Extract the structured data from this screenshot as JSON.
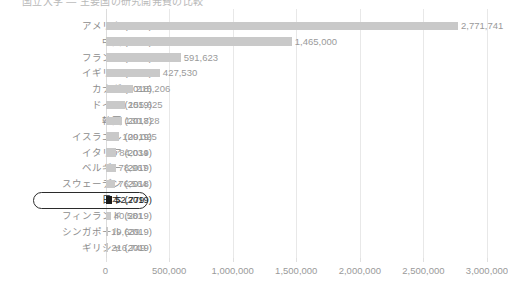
{
  "title": {
    "text": "国立大学 ― 主要国の研究開発費の比較",
    "visible_cropped": true
  },
  "chart_data": {
    "type": "bar",
    "orientation": "horizontal",
    "title": "",
    "xlabel": "",
    "ylabel": "",
    "xlim": [
      0,
      3000000
    ],
    "xticks": [
      0,
      500000,
      1000000,
      1500000,
      2000000,
      2500000,
      3000000
    ],
    "xtick_labels": [
      "0",
      "500,000",
      "1,000,000",
      "1,500,000",
      "2,000,000",
      "2,500,000",
      "3,000,000"
    ],
    "grid": true,
    "legend": "none",
    "highlight_category": "日本 (2019)",
    "categories": [
      "アメリカ (2018)",
      "中国 (2019)",
      "フランス (2018)",
      "イギリス (2019)",
      "カナダ (2018)",
      "ドイツ (2019)",
      "韓国 (2018)",
      "イスラエル (2019)",
      "イタリア (2019)",
      "ベルギー (2019)",
      "スウェーデン (2018)",
      "日本 (2019)",
      "フィンランド (2019)",
      "シンガポール (2019)",
      "ギリシャ (2019)"
    ],
    "values": [
      2771741,
      1465000,
      591623,
      427530,
      215206,
      155625,
      130728,
      109025,
      84034,
      78967,
      76564,
      52779,
      40581,
      19639,
      21674
    ],
    "value_labels": [
      "2,771,741",
      "1,465,000",
      "591,623",
      "427,530",
      "215,206",
      "155,625",
      "130,728",
      "109,025",
      "84,034",
      "78,967",
      "76,564",
      "52,779",
      "40,581",
      "19,639",
      "216,749"
    ]
  },
  "colors": {
    "bar": "#c9c9c9",
    "bar_highlight": "#1b1b1b",
    "text": "#9a9a9a",
    "text_highlight": "#2b2b2b",
    "grid": "#e8e8e8",
    "background": "#ffffff"
  }
}
